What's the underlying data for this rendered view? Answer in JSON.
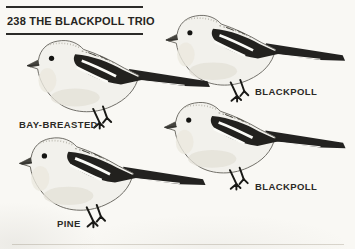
{
  "header": {
    "page_number": "238",
    "title": "THE BLACKPOLL TRIO"
  },
  "birds": [
    {
      "label": "BLACKPOLL",
      "position": "top-right"
    },
    {
      "label": "BAY-BREASTED",
      "position": "middle-left"
    },
    {
      "label": "PINE",
      "position": "bottom-left"
    },
    {
      "label": "BLACKPOLL",
      "position": "bottom-right"
    }
  ],
  "colors": {
    "page_background": "#f9f8f4",
    "ink": "#23221f",
    "label_text": "#2b2a26",
    "wing_dark": "#22211e",
    "body_light": "#f2f1ec"
  }
}
